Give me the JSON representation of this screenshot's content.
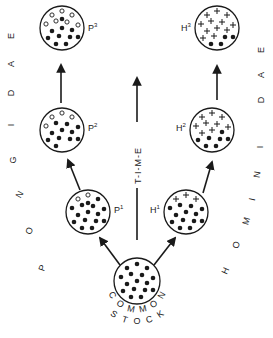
{
  "diagram": {
    "colors": {
      "ink": "#1a1a1a",
      "background": "#ffffff"
    },
    "time_label": "T-I-M-E",
    "time_letters": [
      "T",
      "I",
      "M",
      "E"
    ],
    "lineages": {
      "pongidae": {
        "label": "PONGIDAE",
        "letters": [
          "P",
          "O",
          "N",
          "G",
          "I",
          "D",
          "A",
          "E"
        ]
      },
      "hominidae": {
        "label": "HOMINIDAE",
        "letters": [
          "H",
          "O",
          "M",
          "I",
          "N",
          "I",
          "D",
          "A",
          "E"
        ]
      }
    },
    "common_stock": {
      "label_line1": "COMMON",
      "label_line2": "STOCK",
      "letters1": [
        "C",
        "O",
        "M",
        "M",
        "O",
        "N"
      ],
      "letters2": [
        "S",
        "T",
        "O",
        "C",
        "K"
      ]
    },
    "nodes": [
      {
        "id": "common",
        "label": "",
        "solid": 16,
        "hollow": 0,
        "plus": 0
      },
      {
        "id": "p1",
        "label": "P",
        "sup": "1",
        "solid": 15,
        "hollow": 2,
        "plus": 0
      },
      {
        "id": "p2",
        "label": "P",
        "sup": "2",
        "solid": 11,
        "hollow": 4,
        "plus": 0
      },
      {
        "id": "p3",
        "label": "P",
        "sup": "3",
        "solid": 10,
        "hollow": 7,
        "plus": 0
      },
      {
        "id": "h1",
        "label": "H",
        "sup": "1",
        "solid": 13,
        "hollow": 0,
        "plus": 3
      },
      {
        "id": "h2",
        "label": "H",
        "sup": "2",
        "solid": 7,
        "hollow": 0,
        "plus": 9
      },
      {
        "id": "h3",
        "label": "H",
        "sup": "3",
        "solid": 4,
        "hollow": 0,
        "plus": 12
      }
    ]
  }
}
